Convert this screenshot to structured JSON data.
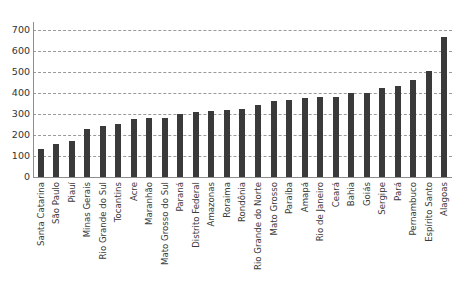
{
  "chart_data": {
    "type": "bar",
    "title": "",
    "subtitle": "",
    "xlabel": "",
    "ylabel": "",
    "ylim": [
      0,
      700
    ],
    "yticks": [
      0,
      100,
      200,
      300,
      400,
      500,
      600,
      700
    ],
    "ytick_labels": [
      "0",
      "100",
      "200",
      "300",
      "400",
      "500",
      "600",
      "700"
    ],
    "grid": "horizontal-dashed",
    "legend": "none",
    "orientation": "vertical",
    "bar_color": "#3a3a3a",
    "categories": [
      "Santa Catarina",
      "São Paulo",
      "Piauí",
      "Minas Gerais",
      "Rio Grande do Sul",
      "Tocantins",
      "Acre",
      "Maranhão",
      "Mato Grosso do Sul",
      "Paraná",
      "Distrito Federal",
      "Amazonas",
      "Roraima",
      "Rondônia",
      "Rio Grande do Norte",
      "Mato Grosso",
      "Paraíba",
      "Amapá",
      "Rio de Janeiro",
      "Ceará",
      "Bahia",
      "Goiás",
      "Sergipe",
      "Pará",
      "Pernambuco",
      "Espírito Santo",
      "Alagoas"
    ],
    "values": [
      133,
      158,
      172,
      228,
      241,
      253,
      275,
      280,
      280,
      300,
      310,
      312,
      318,
      322,
      345,
      360,
      368,
      378,
      380,
      380,
      398,
      400,
      425,
      432,
      462,
      505,
      665
    ]
  },
  "colors": {
    "bar": "#3a3a3a",
    "grid": "#9a9a9a",
    "axis": "#8d8d8d",
    "text": "#333333",
    "background": "#ffffff"
  }
}
